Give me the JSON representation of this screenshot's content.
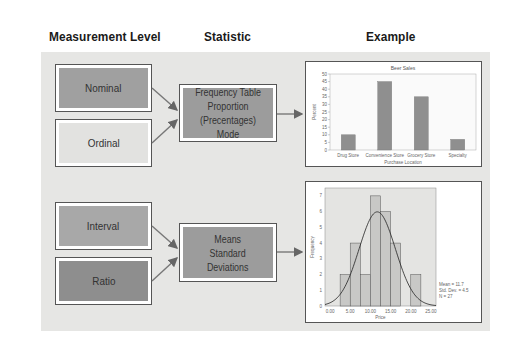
{
  "headers": {
    "measurement_level": "Measurement Level",
    "statistic": "Statistic",
    "example": "Example"
  },
  "colors": {
    "panel": "#e6e6e4",
    "nominal_fill": "#a0a0a0",
    "ordinal_fill": "#e2e2e0",
    "interval_fill": "#a8a8a8",
    "ratio_fill": "#8e8e8e",
    "statistic_fill": "#9c9c9c",
    "bar_fill": "#8f8f8f",
    "arrow": "#666666"
  },
  "rows": [
    {
      "levels": [
        {
          "label": "Nominal"
        },
        {
          "label": "Ordinal"
        }
      ],
      "statistic": {
        "lines": [
          "Frequency Table",
          "Proportion",
          "(Precentages) Mode"
        ]
      }
    },
    {
      "levels": [
        {
          "label": "Interval"
        },
        {
          "label": "Ratio"
        }
      ],
      "statistic": {
        "lines": [
          "Means",
          "Standard",
          "Deviations"
        ]
      }
    }
  ],
  "chart_data": [
    {
      "type": "bar",
      "title": "Beer Sales",
      "xlabel": "Purchase Location",
      "ylabel": "Percent",
      "categories": [
        "Drug Store",
        "Convenience Store",
        "Grocery Store",
        "Specialty"
      ],
      "values": [
        10,
        45,
        35,
        7
      ],
      "ylim": [
        0,
        50
      ],
      "yticks": [
        0,
        5,
        10,
        15,
        20,
        25,
        30,
        35,
        40,
        45,
        50
      ],
      "grid": false
    },
    {
      "type": "bar",
      "subtype": "histogram_with_normal_curve",
      "title": "",
      "xlabel": "Price",
      "ylabel": "Frequency",
      "bin_edges": [
        2.5,
        5.0,
        7.5,
        10.0,
        12.5,
        15.0,
        17.5,
        20.0,
        22.5
      ],
      "values": [
        2,
        4,
        2,
        7,
        6,
        4,
        0,
        2
      ],
      "xlim": [
        -1.25,
        26.25
      ],
      "xticks": [
        "0.00",
        "5.00",
        "10.00",
        "15.00",
        "20.00",
        "25.00"
      ],
      "ylim": [
        0,
        7.5
      ],
      "yticks": [
        0,
        1,
        2,
        3,
        4,
        5,
        6,
        7
      ],
      "stats": {
        "mean": "Mean = 11.7",
        "std": "Std. Dev. = 4.5",
        "n": "N = 27"
      },
      "curve": {
        "mean": 11.7,
        "sd": 4.5,
        "n": 27,
        "bin_width": 2.5
      }
    }
  ]
}
